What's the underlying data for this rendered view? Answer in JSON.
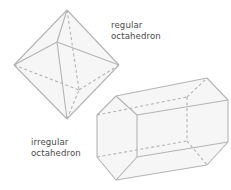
{
  "diagram": {
    "labels": {
      "regular": [
        "regular",
        "octahedron"
      ],
      "irregular": [
        "irregular",
        "octahedron"
      ]
    },
    "colors": {
      "edge": "#b4b4b4",
      "hidden_edge": "#b4b4b4",
      "face_fill": "#f4f4f4",
      "text": "#4a4a4a"
    },
    "shapes": [
      {
        "name": "regular octahedron",
        "type": "octahedron"
      },
      {
        "name": "irregular octahedron",
        "type": "hexagonal prism"
      }
    ]
  }
}
